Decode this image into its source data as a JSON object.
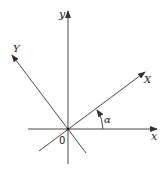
{
  "diagram": {
    "type": "coordinate-rotation",
    "origin_label": "0",
    "axes": {
      "x": {
        "label": "x"
      },
      "y": {
        "label": "y"
      },
      "X": {
        "label": "X"
      },
      "Y": {
        "label": "Y"
      }
    },
    "angle": {
      "label": "α"
    },
    "colors": {
      "line": "#333333",
      "text": "#222222",
      "background": "#ffffff"
    }
  }
}
